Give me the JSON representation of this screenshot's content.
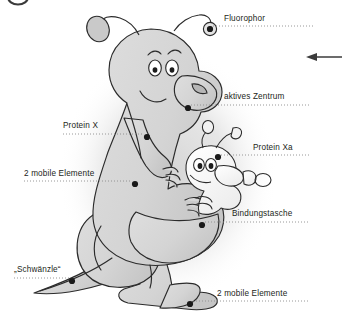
{
  "figure": {
    "kind": "labeled-cartoon-diagram",
    "background_color": "#ffffff",
    "ink_color": "#231f20",
    "body_fill": "#d8d8d8",
    "body_shade": "#c2c2c2",
    "baby_fill": "#fbfbfb",
    "shadow_color": "#dcdcdc",
    "leader_dot_color": "#1a1a1a",
    "leader_line_color": "#8c8c8c"
  },
  "callouts": [
    {
      "id": "fluorophor",
      "label": "Fluorophor",
      "side": "right",
      "text_x": 224,
      "text_y": 15,
      "dot_x": 210,
      "dot_y": 29,
      "leader_from_x": 213,
      "leader_to_x": 313,
      "leader_y": 26
    },
    {
      "id": "aktives-zentrum",
      "label": "aktives Zentrum",
      "side": "right",
      "text_x": 224,
      "text_y": 93,
      "dot_x": 188,
      "dot_y": 108,
      "leader_from_x": 191,
      "leader_to_x": 310,
      "leader_y": 105
    },
    {
      "id": "protein-x",
      "label": "Protein X",
      "side": "left",
      "text_x": 63,
      "text_y": 122,
      "dot_x": 147,
      "dot_y": 137,
      "leader_from_x": 63,
      "leader_to_x": 144,
      "leader_y": 134
    },
    {
      "id": "protein-xa",
      "label": "Protein Xa",
      "side": "right",
      "text_x": 253,
      "text_y": 144,
      "dot_x": 218,
      "dot_y": 157,
      "leader_from_x": 221,
      "leader_to_x": 310,
      "leader_y": 155
    },
    {
      "id": "mobile-elemente-arm",
      "label": "2 mobile Elemente",
      "side": "left",
      "text_x": 24,
      "text_y": 170,
      "dot_x": 135,
      "dot_y": 184,
      "leader_from_x": 24,
      "leader_to_x": 132,
      "leader_y": 181
    },
    {
      "id": "bindungstasche",
      "label": "Bindungstasche",
      "side": "right",
      "text_x": 232,
      "text_y": 210,
      "dot_x": 202,
      "dot_y": 225,
      "leader_from_x": 205,
      "leader_to_x": 310,
      "leader_y": 222
    },
    {
      "id": "schwaenzle",
      "label": "„Schwänzle“",
      "side": "left",
      "text_x": 14,
      "text_y": 266,
      "dot_x": 72,
      "dot_y": 281,
      "leader_from_x": 14,
      "leader_to_x": 69,
      "leader_y": 278
    },
    {
      "id": "mobile-elemente-foot",
      "label": "2 mobile Elemente",
      "side": "right",
      "text_x": 217,
      "text_y": 290,
      "dot_x": 190,
      "dot_y": 304,
      "leader_from_x": 193,
      "leader_to_x": 310,
      "leader_y": 301
    }
  ],
  "markers": {
    "arrow": {
      "name": "left-pointing-arrow",
      "x1": 342,
      "x2": 306,
      "y": 57
    },
    "corner_ring": {
      "name": "cropped-ring-artifact",
      "cx": 18,
      "cy": -2,
      "rx": 10,
      "ry": 7
    }
  }
}
